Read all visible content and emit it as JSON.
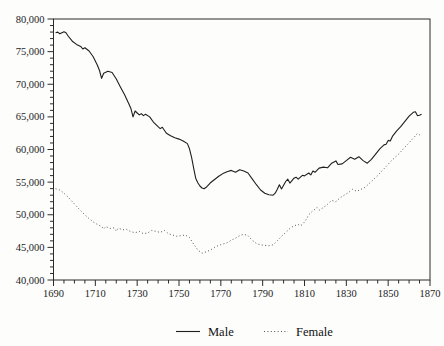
{
  "figure": {
    "background": "#fdfdfc",
    "frame_color": "#2b2b2b",
    "male_line_color": "#1f1f1f",
    "female_line_color": "#555555"
  },
  "legend": {
    "male": "Male",
    "female": "Female",
    "male_style": "solid",
    "female_style": "dotted",
    "position": "bottom-center"
  },
  "axes": {
    "y": {
      "min": 40000,
      "max": 80000,
      "major_step": 5000,
      "minor_step": 1000,
      "tick_values": [
        80000,
        75000,
        70000,
        65000,
        60000,
        55000,
        50000,
        45000,
        40000
      ],
      "tick_labels": [
        "80,000",
        "75,000",
        "70,000",
        "65,000",
        "60,000",
        "55,000",
        "50,000",
        "45,000",
        "40,000"
      ]
    },
    "x": {
      "min": 1690,
      "max": 1870,
      "major_step": 20,
      "minor_step": 5,
      "tick_values": [
        1690,
        1710,
        1730,
        1750,
        1770,
        1790,
        1810,
        1830,
        1850,
        1870
      ],
      "tick_labels": [
        "1690",
        "1710",
        "1730",
        "1750",
        "1770",
        "1790",
        "1810",
        "1830",
        "1850",
        "1870"
      ]
    }
  },
  "chart_data": {
    "type": "line",
    "title": "",
    "xlabel": "",
    "ylabel": "",
    "xlim": [
      1690,
      1870
    ],
    "ylim": [
      40000,
      80000
    ],
    "grid": false,
    "legend_position": "bottom-center",
    "series": [
      {
        "name": "Male",
        "style": "solid",
        "points": [
          [
            1691,
            77900
          ],
          [
            1692,
            78000
          ],
          [
            1693,
            77750
          ],
          [
            1694,
            77900
          ],
          [
            1695,
            78050
          ],
          [
            1696,
            77900
          ],
          [
            1697,
            77400
          ],
          [
            1699,
            76600
          ],
          [
            1701,
            76100
          ],
          [
            1703,
            75800
          ],
          [
            1704,
            75400
          ],
          [
            1705,
            75600
          ],
          [
            1707,
            75100
          ],
          [
            1709,
            74200
          ],
          [
            1711,
            72900
          ],
          [
            1712,
            72100
          ],
          [
            1713,
            70900
          ],
          [
            1714,
            71700
          ],
          [
            1716,
            72000
          ],
          [
            1718,
            71800
          ],
          [
            1720,
            70800
          ],
          [
            1722,
            69600
          ],
          [
            1724,
            68400
          ],
          [
            1726,
            67000
          ],
          [
            1727,
            66300
          ],
          [
            1728,
            65000
          ],
          [
            1729,
            65900
          ],
          [
            1730,
            65600
          ],
          [
            1731,
            65300
          ],
          [
            1732,
            65500
          ],
          [
            1733,
            65200
          ],
          [
            1734,
            65400
          ],
          [
            1736,
            65000
          ],
          [
            1738,
            64100
          ],
          [
            1740,
            63500
          ],
          [
            1741,
            63200
          ],
          [
            1742,
            63400
          ],
          [
            1744,
            62500
          ],
          [
            1746,
            62100
          ],
          [
            1748,
            61800
          ],
          [
            1750,
            61600
          ],
          [
            1752,
            61300
          ],
          [
            1754,
            60900
          ],
          [
            1755,
            60100
          ],
          [
            1756,
            58800
          ],
          [
            1757,
            57200
          ],
          [
            1758,
            55600
          ],
          [
            1759,
            54900
          ],
          [
            1760,
            54400
          ],
          [
            1761,
            54100
          ],
          [
            1762,
            54000
          ],
          [
            1763,
            54200
          ],
          [
            1765,
            54900
          ],
          [
            1767,
            55400
          ],
          [
            1769,
            55900
          ],
          [
            1771,
            56300
          ],
          [
            1773,
            56600
          ],
          [
            1775,
            56800
          ],
          [
            1777,
            56500
          ],
          [
            1779,
            56900
          ],
          [
            1781,
            56700
          ],
          [
            1783,
            56400
          ],
          [
            1785,
            55500
          ],
          [
            1787,
            54600
          ],
          [
            1789,
            53800
          ],
          [
            1791,
            53300
          ],
          [
            1793,
            53050
          ],
          [
            1795,
            53000
          ],
          [
            1796,
            53300
          ],
          [
            1797,
            53900
          ],
          [
            1798,
            54600
          ],
          [
            1799,
            53950
          ],
          [
            1801,
            55100
          ],
          [
            1802,
            55450
          ],
          [
            1803,
            54850
          ],
          [
            1805,
            55600
          ],
          [
            1806,
            55750
          ],
          [
            1807,
            55450
          ],
          [
            1809,
            56050
          ],
          [
            1810,
            55950
          ],
          [
            1812,
            56400
          ],
          [
            1813,
            56100
          ],
          [
            1814,
            56700
          ],
          [
            1815,
            56500
          ],
          [
            1817,
            57150
          ],
          [
            1819,
            57300
          ],
          [
            1821,
            57200
          ],
          [
            1823,
            57900
          ],
          [
            1825,
            58250
          ],
          [
            1826,
            57700
          ],
          [
            1828,
            57800
          ],
          [
            1830,
            58300
          ],
          [
            1832,
            58800
          ],
          [
            1834,
            58500
          ],
          [
            1836,
            58900
          ],
          [
            1838,
            58300
          ],
          [
            1840,
            57900
          ],
          [
            1842,
            58500
          ],
          [
            1844,
            59300
          ],
          [
            1846,
            60100
          ],
          [
            1848,
            60700
          ],
          [
            1849,
            60800
          ],
          [
            1850,
            61400
          ],
          [
            1851,
            61300
          ],
          [
            1852,
            62000
          ],
          [
            1854,
            62800
          ],
          [
            1856,
            63500
          ],
          [
            1858,
            64300
          ],
          [
            1860,
            65100
          ],
          [
            1862,
            65700
          ],
          [
            1863,
            65800
          ],
          [
            1864,
            65200
          ],
          [
            1865,
            65250
          ],
          [
            1866,
            65400
          ]
        ]
      },
      {
        "name": "Female",
        "style": "dotted",
        "points": [
          [
            1691,
            54000
          ],
          [
            1693,
            53800
          ],
          [
            1695,
            53300
          ],
          [
            1697,
            52700
          ],
          [
            1699,
            52000
          ],
          [
            1701,
            51300
          ],
          [
            1703,
            50600
          ],
          [
            1705,
            50000
          ],
          [
            1707,
            49400
          ],
          [
            1709,
            48900
          ],
          [
            1711,
            48500
          ],
          [
            1713,
            48200
          ],
          [
            1714,
            47800
          ],
          [
            1715,
            48200
          ],
          [
            1717,
            47900
          ],
          [
            1719,
            48000
          ],
          [
            1720,
            47500
          ],
          [
            1721,
            47950
          ],
          [
            1723,
            47700
          ],
          [
            1725,
            47750
          ],
          [
            1727,
            47400
          ],
          [
            1729,
            47250
          ],
          [
            1731,
            47450
          ],
          [
            1733,
            47100
          ],
          [
            1735,
            47200
          ],
          [
            1737,
            47600
          ],
          [
            1739,
            47450
          ],
          [
            1741,
            47300
          ],
          [
            1743,
            47600
          ],
          [
            1745,
            47100
          ],
          [
            1747,
            46900
          ],
          [
            1749,
            46700
          ],
          [
            1751,
            46800
          ],
          [
            1753,
            46900
          ],
          [
            1755,
            46500
          ],
          [
            1757,
            45500
          ],
          [
            1759,
            44600
          ],
          [
            1761,
            44100
          ],
          [
            1763,
            44300
          ],
          [
            1765,
            44600
          ],
          [
            1767,
            45000
          ],
          [
            1769,
            45300
          ],
          [
            1771,
            45500
          ],
          [
            1773,
            45700
          ],
          [
            1775,
            46100
          ],
          [
            1777,
            46400
          ],
          [
            1779,
            46800
          ],
          [
            1781,
            47000
          ],
          [
            1783,
            46800
          ],
          [
            1785,
            46100
          ],
          [
            1787,
            45600
          ],
          [
            1789,
            45400
          ],
          [
            1791,
            45300
          ],
          [
            1793,
            45250
          ],
          [
            1795,
            45400
          ],
          [
            1797,
            46000
          ],
          [
            1799,
            46700
          ],
          [
            1801,
            47300
          ],
          [
            1803,
            47900
          ],
          [
            1805,
            48300
          ],
          [
            1807,
            48500
          ],
          [
            1808,
            48300
          ],
          [
            1809,
            48500
          ],
          [
            1810,
            48900
          ],
          [
            1811,
            49400
          ],
          [
            1812,
            50000
          ],
          [
            1814,
            50600
          ],
          [
            1816,
            51100
          ],
          [
            1817,
            50700
          ],
          [
            1819,
            51100
          ],
          [
            1821,
            51600
          ],
          [
            1823,
            52200
          ],
          [
            1825,
            52000
          ],
          [
            1827,
            52600
          ],
          [
            1829,
            53000
          ],
          [
            1831,
            53400
          ],
          [
            1833,
            53900
          ],
          [
            1835,
            53600
          ],
          [
            1837,
            53900
          ],
          [
            1839,
            54200
          ],
          [
            1841,
            54800
          ],
          [
            1843,
            55400
          ],
          [
            1845,
            56000
          ],
          [
            1847,
            56700
          ],
          [
            1849,
            57400
          ],
          [
            1851,
            58100
          ],
          [
            1853,
            58700
          ],
          [
            1855,
            59300
          ],
          [
            1857,
            60000
          ],
          [
            1859,
            60700
          ],
          [
            1861,
            61400
          ],
          [
            1863,
            62100
          ],
          [
            1864,
            62450
          ],
          [
            1865,
            62250
          ],
          [
            1866,
            62550
          ]
        ]
      }
    ]
  }
}
